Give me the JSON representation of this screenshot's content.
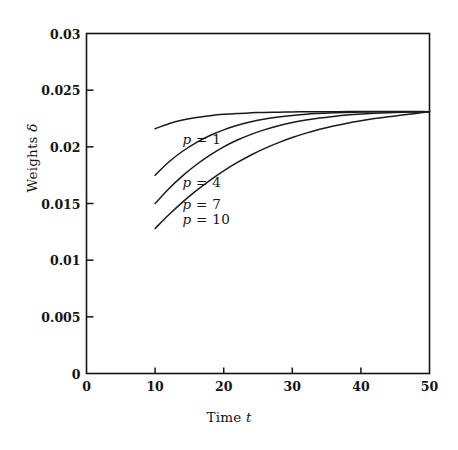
{
  "chart_data": {
    "type": "line",
    "title": "",
    "subtitle": "",
    "xlabel": "Time t",
    "xlabel_text": "Time ",
    "xlabel_var": "t",
    "ylabel": "Weights δ",
    "ylabel_text": "Weights ",
    "ylabel_var": "δ",
    "xlim": [
      0,
      50
    ],
    "ylim": [
      0,
      0.03
    ],
    "grid": false,
    "legend_position": "inside-left",
    "line_color": "#1a1a1a",
    "axis_color": "#141414",
    "background_color": "#ffffff",
    "xticks": [
      0,
      10,
      20,
      30,
      40,
      50
    ],
    "xtick_labels": [
      "0",
      "10",
      "20",
      "30",
      "40",
      "50"
    ],
    "yticks": [
      0,
      0.005,
      0.01,
      0.015,
      0.02,
      0.025,
      0.03
    ],
    "ytick_labels": [
      "0",
      "0.005",
      "0.01",
      "0.015",
      "0.02",
      "0.025",
      "0.03"
    ],
    "x": [
      10,
      12,
      14,
      16,
      18,
      20,
      22,
      24,
      26,
      28,
      30,
      32,
      34,
      36,
      38,
      40,
      42,
      44,
      46,
      48,
      50
    ],
    "series": [
      {
        "name": "p = 1",
        "label_text": "p",
        "label_eq": " = 1",
        "p": 1,
        "label_x": 14.0,
        "label_y": 0.0207,
        "values": [
          0.0216,
          0.02204,
          0.02236,
          0.02259,
          0.02275,
          0.02287,
          0.02295,
          0.023,
          0.02304,
          0.02306,
          0.02308,
          0.02309,
          0.0231,
          0.0231,
          0.02311,
          0.02311,
          0.02311,
          0.02311,
          0.02311,
          0.02311,
          0.0231
        ]
      },
      {
        "name": "p = 4",
        "label_text": "p",
        "label_eq": " = 4",
        "p": 4,
        "label_x": 14.0,
        "label_y": 0.0169,
        "values": [
          0.0175,
          0.01866,
          0.01961,
          0.02038,
          0.021,
          0.0215,
          0.0219,
          0.02221,
          0.02245,
          0.02263,
          0.02277,
          0.02288,
          0.02295,
          0.02301,
          0.02304,
          0.02307,
          0.02309,
          0.0231,
          0.0231,
          0.0231,
          0.0231
        ]
      },
      {
        "name": "p = 7",
        "label_text": "p",
        "label_eq": " = 7",
        "p": 7,
        "label_x": 14.0,
        "label_y": 0.015,
        "values": [
          0.015,
          0.0163,
          0.01744,
          0.01842,
          0.01927,
          0.02,
          0.0206,
          0.0211,
          0.02152,
          0.02186,
          0.02214,
          0.02236,
          0.02254,
          0.02268,
          0.0228,
          0.02289,
          0.02296,
          0.02301,
          0.02305,
          0.02308,
          0.0231
        ]
      },
      {
        "name": "p = 10",
        "label_text": "p",
        "label_eq": " = 10",
        "p": 10,
        "label_x": 14.0,
        "label_y": 0.0136,
        "values": [
          0.0128,
          0.014,
          0.01512,
          0.01613,
          0.01705,
          0.01788,
          0.01862,
          0.01928,
          0.01986,
          0.02037,
          0.02082,
          0.02121,
          0.02155,
          0.02184,
          0.02209,
          0.0223,
          0.02249,
          0.02265,
          0.0228,
          0.02295,
          0.0231
        ]
      }
    ]
  }
}
